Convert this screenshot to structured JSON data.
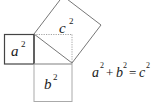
{
  "figure": {
    "title_fragment": "",
    "squares": {
      "a": {
        "base": "a",
        "exp": "2",
        "color": "#444444"
      },
      "b": {
        "base": "b",
        "exp": "2",
        "color": "#aaaaaa"
      },
      "c": {
        "base": "c",
        "exp": "2",
        "color": "#777777"
      }
    },
    "equation": {
      "a": "a",
      "a_exp": "2",
      "plus": "+",
      "b": "b",
      "b_exp": "2",
      "equals": "=",
      "c": "c",
      "c_exp": "2"
    },
    "dotted_color": "#999999"
  }
}
